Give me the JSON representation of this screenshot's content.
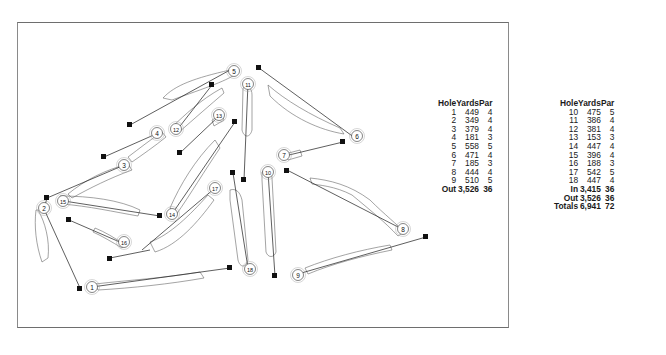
{
  "diagram": {
    "type": "golf-course-layout",
    "holes": [
      {
        "number": "1"
      },
      {
        "number": "2"
      },
      {
        "number": "3"
      },
      {
        "number": "4"
      },
      {
        "number": "5"
      },
      {
        "number": "6"
      },
      {
        "number": "7"
      },
      {
        "number": "8"
      },
      {
        "number": "9"
      },
      {
        "number": "10"
      },
      {
        "number": "11"
      },
      {
        "number": "12"
      },
      {
        "number": "13"
      },
      {
        "number": "14"
      },
      {
        "number": "15"
      },
      {
        "number": "16"
      },
      {
        "number": "17"
      },
      {
        "number": "18"
      }
    ]
  },
  "scorecard": {
    "front": {
      "headers": {
        "hole": "Hole",
        "yards": "Yards",
        "par": "Par"
      },
      "rows": [
        {
          "hole": "1",
          "yards": "449",
          "par": "4"
        },
        {
          "hole": "2",
          "yards": "349",
          "par": "4"
        },
        {
          "hole": "3",
          "yards": "379",
          "par": "4"
        },
        {
          "hole": "4",
          "yards": "181",
          "par": "3"
        },
        {
          "hole": "5",
          "yards": "558",
          "par": "5"
        },
        {
          "hole": "6",
          "yards": "471",
          "par": "4"
        },
        {
          "hole": "7",
          "yards": "185",
          "par": "3"
        },
        {
          "hole": "8",
          "yards": "444",
          "par": "4"
        },
        {
          "hole": "9",
          "yards": "510",
          "par": "5"
        }
      ],
      "total": {
        "label": "Out",
        "yards": "3,526",
        "par": "36"
      }
    },
    "back": {
      "headers": {
        "hole": "Hole",
        "yards": "Yards",
        "par": "Par"
      },
      "rows": [
        {
          "hole": "10",
          "yards": "475",
          "par": "5"
        },
        {
          "hole": "11",
          "yards": "386",
          "par": "4"
        },
        {
          "hole": "12",
          "yards": "381",
          "par": "4"
        },
        {
          "hole": "13",
          "yards": "153",
          "par": "3"
        },
        {
          "hole": "14",
          "yards": "447",
          "par": "4"
        },
        {
          "hole": "15",
          "yards": "396",
          "par": "4"
        },
        {
          "hole": "16",
          "yards": "188",
          "par": "3"
        },
        {
          "hole": "17",
          "yards": "542",
          "par": "5"
        },
        {
          "hole": "18",
          "yards": "447",
          "par": "4"
        }
      ],
      "totals": [
        {
          "label": "In",
          "yards": "3,415",
          "par": "36"
        },
        {
          "label": "Out",
          "yards": "3,526",
          "par": "36"
        },
        {
          "label": "Totals",
          "yards": "6,941",
          "par": "72"
        }
      ]
    }
  },
  "colors": {
    "line": "#1a1a1a",
    "fairway": "#555555",
    "frame": "#7a7a7a"
  }
}
